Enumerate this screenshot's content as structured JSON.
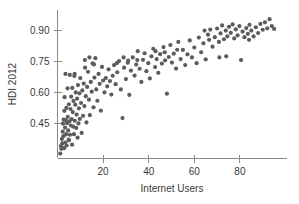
{
  "chart_data": {
    "type": "scatter",
    "title": "",
    "xlabel": "Internet Users",
    "ylabel": "HDI 2012",
    "xlim": [
      0,
      100
    ],
    "ylim": [
      0.28,
      0.99
    ],
    "xticks": [
      20,
      40,
      60,
      80
    ],
    "yticks": [
      0.45,
      0.6,
      0.75,
      0.9
    ],
    "xtick_labels": [
      "20",
      "40",
      "60",
      "80"
    ],
    "ytick_labels": [
      "0.45",
      "0.60",
      "0.75",
      "0.90"
    ],
    "grid": false,
    "legend": "none",
    "marker_color": "#5c5c5c",
    "marker_size": 2.1,
    "background_color": "#ffffff",
    "axis_color": "#8a8a8a",
    "n_points": 182,
    "points": [
      [
        1.2,
        0.304
      ],
      [
        1.5,
        0.34
      ],
      [
        1.7,
        0.327
      ],
      [
        1.9,
        0.374
      ],
      [
        2.1,
        0.353
      ],
      [
        2.3,
        0.41
      ],
      [
        2.4,
        0.449
      ],
      [
        2.6,
        0.388
      ],
      [
        2.7,
        0.468
      ],
      [
        2.9,
        0.33
      ],
      [
        3.0,
        0.511
      ],
      [
        3.1,
        0.577
      ],
      [
        3.3,
        0.43
      ],
      [
        3.4,
        0.357
      ],
      [
        3.6,
        0.466
      ],
      [
        3.8,
        0.398
      ],
      [
        3.9,
        0.525
      ],
      [
        4.0,
        0.343
      ],
      [
        4.2,
        0.451
      ],
      [
        4.4,
        0.62
      ],
      [
        4.5,
        0.482
      ],
      [
        4.7,
        0.416
      ],
      [
        4.9,
        0.372
      ],
      [
        5.0,
        0.543
      ],
      [
        5.2,
        0.46
      ],
      [
        5.4,
        0.685
      ],
      [
        5.5,
        0.395
      ],
      [
        5.7,
        0.52
      ],
      [
        5.9,
        0.44
      ],
      [
        6.0,
        0.58
      ],
      [
        6.2,
        0.471
      ],
      [
        6.4,
        0.347
      ],
      [
        6.5,
        0.622
      ],
      [
        6.7,
        0.505
      ],
      [
        6.9,
        0.434
      ],
      [
        7.0,
        0.559
      ],
      [
        7.2,
        0.398
      ],
      [
        7.4,
        0.68
      ],
      [
        7.6,
        0.463
      ],
      [
        7.8,
        0.541
      ],
      [
        8.0,
        0.6
      ],
      [
        8.2,
        0.428
      ],
      [
        8.4,
        0.493
      ],
      [
        8.6,
        0.57
      ],
      [
        8.8,
        0.381
      ],
      [
        9.0,
        0.636
      ],
      [
        9.2,
        0.45
      ],
      [
        9.4,
        0.523
      ],
      [
        9.6,
        0.596
      ],
      [
        9.8,
        0.472
      ],
      [
        10.0,
        0.67
      ],
      [
        10.3,
        0.549
      ],
      [
        10.6,
        0.404
      ],
      [
        10.9,
        0.61
      ],
      [
        11.2,
        0.487
      ],
      [
        11.5,
        0.643
      ],
      [
        11.8,
        0.534
      ],
      [
        12.1,
        0.72
      ],
      [
        12.4,
        0.582
      ],
      [
        12.7,
        0.455
      ],
      [
        13.0,
        0.627
      ],
      [
        13.4,
        0.7
      ],
      [
        13.8,
        0.565
      ],
      [
        14.2,
        0.49
      ],
      [
        14.6,
        0.651
      ],
      [
        15.0,
        0.604
      ],
      [
        15.4,
        0.741
      ],
      [
        15.8,
        0.528
      ],
      [
        16.2,
        0.672
      ],
      [
        16.6,
        0.766
      ],
      [
        17.0,
        0.615
      ],
      [
        17.5,
        0.56
      ],
      [
        18.0,
        0.69
      ],
      [
        18.5,
        0.642
      ],
      [
        19.0,
        0.512
      ],
      [
        19.5,
        0.724
      ],
      [
        20.0,
        0.658
      ],
      [
        20.6,
        0.6
      ],
      [
        21.2,
        0.67
      ],
      [
        21.8,
        0.63
      ],
      [
        22.4,
        0.712
      ],
      [
        23.0,
        0.655
      ],
      [
        23.6,
        0.59
      ],
      [
        24.2,
        0.681
      ],
      [
        24.8,
        0.733
      ],
      [
        25.5,
        0.64
      ],
      [
        26.2,
        0.698
      ],
      [
        27.0,
        0.752
      ],
      [
        27.8,
        0.615
      ],
      [
        28.5,
        0.476
      ],
      [
        29.2,
        0.72
      ],
      [
        30.0,
        0.665
      ],
      [
        30.8,
        0.744
      ],
      [
        31.5,
        0.588
      ],
      [
        32.2,
        0.706
      ],
      [
        33.0,
        0.77
      ],
      [
        33.8,
        0.682
      ],
      [
        34.5,
        0.735
      ],
      [
        35.2,
        0.8
      ],
      [
        36.0,
        0.715
      ],
      [
        36.8,
        0.651
      ],
      [
        37.5,
        0.758
      ],
      [
        38.2,
        0.79
      ],
      [
        39.0,
        0.703
      ],
      [
        39.8,
        0.742
      ],
      [
        40.5,
        0.668
      ],
      [
        41.2,
        0.775
      ],
      [
        42.0,
        0.812
      ],
      [
        42.8,
        0.723
      ],
      [
        43.5,
        0.762
      ],
      [
        44.2,
        0.695
      ],
      [
        45.0,
        0.786
      ],
      [
        45.8,
        0.74
      ],
      [
        46.5,
        0.82
      ],
      [
        47.2,
        0.756
      ],
      [
        48.0,
        0.594
      ],
      [
        48.8,
        0.772
      ],
      [
        49.5,
        0.83
      ],
      [
        50.2,
        0.745
      ],
      [
        51.0,
        0.788
      ],
      [
        52.0,
        0.716
      ],
      [
        53.0,
        0.845
      ],
      [
        54.0,
        0.762
      ],
      [
        55.0,
        0.806
      ],
      [
        56.0,
        0.733
      ],
      [
        57.0,
        0.785
      ],
      [
        58.0,
        0.852
      ],
      [
        59.0,
        0.77
      ],
      [
        60.0,
        0.818
      ],
      [
        61.0,
        0.742
      ],
      [
        62.0,
        0.866
      ],
      [
        63.0,
        0.795
      ],
      [
        64.0,
        0.838
      ],
      [
        65.0,
        0.76
      ],
      [
        66.0,
        0.88
      ],
      [
        67.0,
        0.905
      ],
      [
        68.0,
        0.822
      ],
      [
        69.0,
        0.868
      ],
      [
        70.0,
        0.91
      ],
      [
        70.8,
        0.845
      ],
      [
        71.5,
        0.886
      ],
      [
        72.2,
        0.925
      ],
      [
        73.0,
        0.858
      ],
      [
        73.8,
        0.9
      ],
      [
        74.5,
        0.872
      ],
      [
        75.2,
        0.918
      ],
      [
        76.0,
        0.889
      ],
      [
        76.8,
        0.93
      ],
      [
        77.5,
        0.862
      ],
      [
        78.2,
        0.906
      ],
      [
        79.0,
        0.877
      ],
      [
        79.8,
        0.922
      ],
      [
        80.5,
        0.757
      ],
      [
        81.2,
        0.895
      ],
      [
        82.0,
        0.868
      ],
      [
        82.8,
        0.912
      ],
      [
        83.5,
        0.884
      ],
      [
        84.2,
        0.928
      ],
      [
        85.0,
        0.9
      ],
      [
        86.0,
        0.872
      ],
      [
        87.0,
        0.916
      ],
      [
        88.0,
        0.888
      ],
      [
        89.0,
        0.932
      ],
      [
        90.0,
        0.904
      ],
      [
        91.0,
        0.94
      ],
      [
        92.0,
        0.911
      ],
      [
        93.0,
        0.955
      ],
      [
        94.0,
        0.922
      ],
      [
        95.0,
        0.908
      ],
      [
        12.0,
        0.757
      ],
      [
        14.0,
        0.77
      ],
      [
        16.0,
        0.736
      ],
      [
        26.0,
        0.742
      ],
      [
        29.0,
        0.77
      ],
      [
        31.0,
        0.755
      ],
      [
        35.0,
        0.757
      ],
      [
        43.0,
        0.8
      ],
      [
        47.0,
        0.795
      ],
      [
        52.5,
        0.807
      ],
      [
        64.5,
        0.9
      ],
      [
        66.5,
        0.855
      ],
      [
        71.0,
        0.77
      ],
      [
        74.0,
        0.775
      ],
      [
        84.0,
        0.855
      ],
      [
        7.5,
        0.69
      ],
      [
        3.5,
        0.69
      ],
      [
        5.0,
        0.368
      ]
    ]
  }
}
